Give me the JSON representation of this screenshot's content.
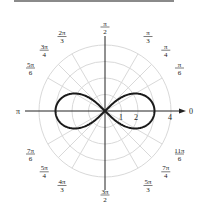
{
  "chart_data": {
    "type": "polar-line",
    "title": "",
    "equation": "r^2 = 9 cos(2θ)",
    "curve_name": "lemniscate",
    "max_r": 3,
    "radial_ticks": [
      "1",
      "2",
      "4"
    ],
    "radial_gridlines": [
      1,
      2,
      3,
      4
    ],
    "angle_labels": [
      {
        "id": "a0",
        "text": "0",
        "angle_deg": 0
      },
      {
        "id": "a30",
        "num": "π",
        "den": "6",
        "angle_deg": 30
      },
      {
        "id": "a45",
        "num": "π",
        "den": "4",
        "angle_deg": 45
      },
      {
        "id": "a60",
        "num": "π",
        "den": "3",
        "angle_deg": 60
      },
      {
        "id": "a90",
        "num": "π",
        "den": "2",
        "angle_deg": 90
      },
      {
        "id": "a120",
        "num": "2π",
        "den": "3",
        "angle_deg": 120
      },
      {
        "id": "a135",
        "num": "3π",
        "den": "4",
        "angle_deg": 135
      },
      {
        "id": "a150",
        "num": "5π",
        "den": "6",
        "angle_deg": 150
      },
      {
        "id": "a180",
        "text": "π",
        "angle_deg": 180
      },
      {
        "id": "a210",
        "num": "7π",
        "den": "6",
        "angle_deg": 210
      },
      {
        "id": "a225",
        "num": "5π",
        "den": "4",
        "angle_deg": 225
      },
      {
        "id": "a240",
        "num": "4π",
        "den": "3",
        "angle_deg": 240
      },
      {
        "id": "a270",
        "num": "3π",
        "den": "2",
        "angle_deg": 270
      },
      {
        "id": "a300",
        "num": "5π",
        "den": "3",
        "angle_deg": 300
      },
      {
        "id": "a315",
        "num": "7π",
        "den": "4",
        "angle_deg": 315
      },
      {
        "id": "a330",
        "num": "11π",
        "den": "6",
        "angle_deg": 330
      }
    ],
    "grid": true,
    "legend": null
  },
  "colors": {
    "curve": "#1a1a1a",
    "axis": "#222222",
    "grid": "#d9d9d9"
  }
}
